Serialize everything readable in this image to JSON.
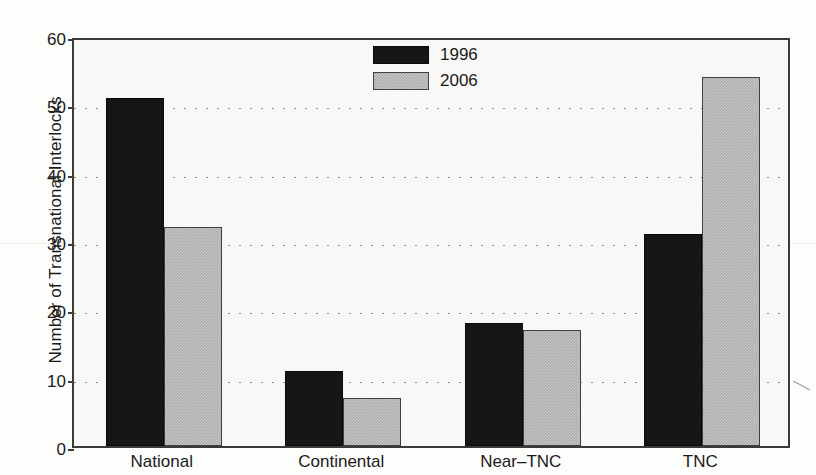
{
  "chart_data": {
    "type": "bar",
    "title": "",
    "xlabel": "",
    "ylabel": "Number of Transnational Interlocks",
    "categories": [
      "National",
      "Continental",
      "Near–TNC",
      "TNC"
    ],
    "series": [
      {
        "name": "1996",
        "color": "#161616",
        "values": [
          51,
          11,
          18,
          31
        ]
      },
      {
        "name": "2006",
        "color": "#adadad",
        "values": [
          32,
          7,
          17,
          54
        ]
      }
    ],
    "ylim": [
      0,
      60
    ],
    "yticks": [
      0,
      10,
      20,
      30,
      40,
      50,
      60
    ],
    "ytick_labels": [
      "0",
      "10",
      "20",
      "30",
      "40",
      "50",
      "60"
    ],
    "grid": true,
    "grid_style": "dotted",
    "legend_position": "top-center",
    "legend_entries": [
      "1996",
      "2006"
    ]
  }
}
